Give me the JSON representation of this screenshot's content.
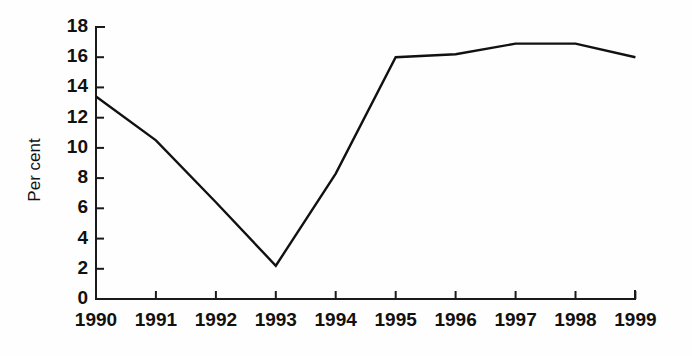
{
  "chart_data": {
    "type": "line",
    "title": "",
    "subtitle": "",
    "xlabel": "",
    "ylabel": "Per cent",
    "categories": [
      "1990",
      "1991",
      "1992",
      "1993",
      "1994",
      "1995",
      "1996",
      "1997",
      "1998",
      "1999"
    ],
    "x": [
      1990,
      1991,
      1992,
      1993,
      1994,
      1995,
      1996,
      1997,
      1998,
      1999
    ],
    "values": [
      13.4,
      10.5,
      6.4,
      2.2,
      8.3,
      16.0,
      16.2,
      16.9,
      16.9,
      16.0
    ],
    "series": [
      {
        "name": "Per cent",
        "values": [
          13.4,
          10.5,
          6.4,
          2.2,
          8.3,
          16.0,
          16.2,
          16.9,
          16.9,
          16.0
        ],
        "color": "#111111"
      }
    ],
    "ylim": [
      0,
      18
    ],
    "xlim": [
      1990,
      1999
    ],
    "ytick_labels": [
      "0",
      "2",
      "4",
      "6",
      "8",
      "10",
      "12",
      "14",
      "16",
      "18"
    ],
    "ytick_values": [
      0,
      2,
      4,
      6,
      8,
      10,
      12,
      14,
      16,
      18
    ],
    "xtick_labels": [
      "1990",
      "1991",
      "1992",
      "1993",
      "1994",
      "1995",
      "1996",
      "1997",
      "1998",
      "1999"
    ],
    "grid": false,
    "legend": false,
    "legend_position": "none",
    "annotations": []
  },
  "style": {
    "background_color": "#fefefe",
    "axis_color": "#1a1a1a",
    "text_color": "#111111",
    "line_color": "#111111"
  }
}
